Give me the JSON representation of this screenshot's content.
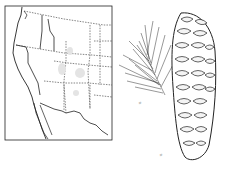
{
  "figure": {
    "map": {
      "region": "western-united-states-range-map",
      "border_style": "dashed-state-lines"
    },
    "illustration": {
      "subject": "conifer-cone-and-needle-branch",
      "branch_scale_label": "½",
      "cone_scale_label": "½"
    },
    "colors": {
      "ink": "#222222",
      "background": "#ffffff",
      "range_shade": "#e4e4e4"
    }
  }
}
